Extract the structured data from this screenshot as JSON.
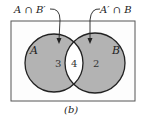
{
  "diagram": {
    "type": "venn",
    "caption": "(b)",
    "sets": [
      {
        "name": "A",
        "label": "A",
        "region_value": "3",
        "center": [
          54,
          63
        ],
        "radius": 29
      },
      {
        "name": "B",
        "label": "B",
        "region_value": "2",
        "center": [
          95,
          63
        ],
        "radius": 30
      }
    ],
    "intersection_value": "4",
    "callouts": [
      {
        "text": "A ∩ B′",
        "points_to": "A only"
      },
      {
        "text": "A′ ∩ B",
        "points_to": "B only"
      }
    ],
    "colors": {
      "shaded": "#b3b3b3",
      "unshaded": "#ffffff",
      "outline": "#222222",
      "frame": "#555555"
    }
  }
}
